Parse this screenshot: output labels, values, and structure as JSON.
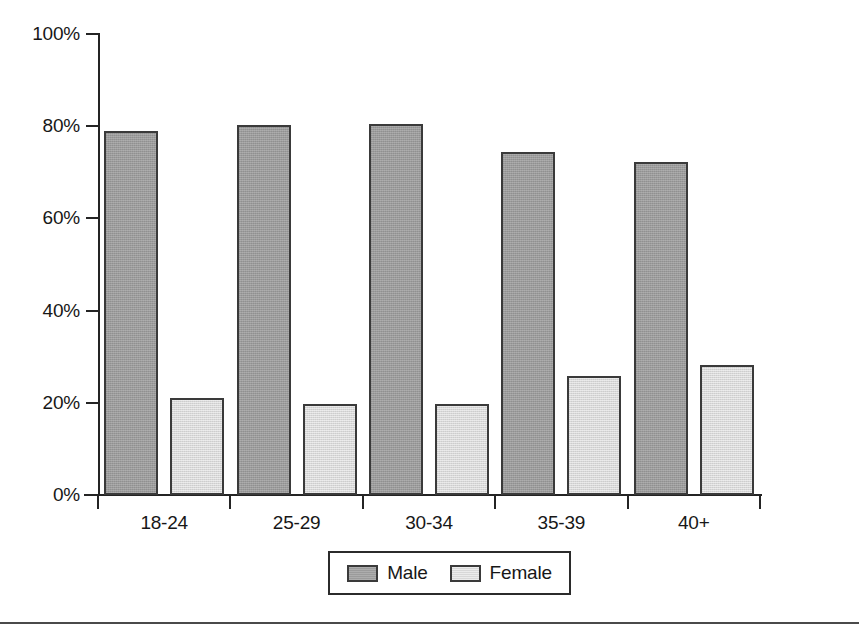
{
  "chart_data": {
    "type": "bar",
    "title": "",
    "subtitle": "",
    "xlabel": "",
    "ylabel": "",
    "categories": [
      "18-24",
      "25-29",
      "30-34",
      "35-39",
      "40+"
    ],
    "series": [
      {
        "name": "Male",
        "color": "#9b9b9b",
        "values": [
          79.0,
          80.3,
          80.4,
          74.4,
          72.3
        ]
      },
      {
        "name": "Female",
        "color": "#d8d8d8",
        "values": [
          21.0,
          19.8,
          19.7,
          25.8,
          28.1
        ]
      }
    ],
    "ylim": [
      0,
      100
    ],
    "ytick_values": [
      0,
      20,
      40,
      60,
      80,
      100
    ],
    "ytick_labels": [
      "0%",
      "20%",
      "40%",
      "60%",
      "80%",
      "100%"
    ],
    "grid": false,
    "legend_position": "bottom-center",
    "value_format": "percent",
    "annotations": []
  },
  "legend": {
    "entries": [
      {
        "label": "Male",
        "swatch": "male-swatch"
      },
      {
        "label": "Female",
        "swatch": "female-swatch"
      }
    ]
  },
  "colors": {
    "male_fill": "#9b9b9b",
    "female_fill": "#d8d8d8",
    "bar_outline": "#3a3a3a",
    "axis": "#242424",
    "text": "#171717",
    "background": "#ffffff",
    "rule": "#4a4a4a"
  }
}
